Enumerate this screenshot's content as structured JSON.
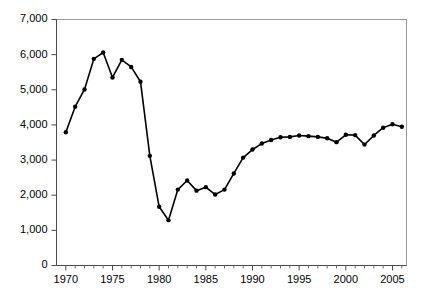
{
  "chart_data": {
    "type": "line",
    "title": "",
    "xlabel": "",
    "ylabel": "",
    "xlim": [
      1969,
      2006.5
    ],
    "ylim": [
      0,
      7000
    ],
    "grid": false,
    "legend": null,
    "y_ticks": [
      0,
      1000,
      2000,
      3000,
      4000,
      5000,
      6000,
      7000
    ],
    "y_tick_labels": [
      "0",
      "1,000",
      "2,000",
      "3,000",
      "4,000",
      "5,000",
      "6,000",
      "7,000"
    ],
    "x_ticks": [
      1970,
      1975,
      1980,
      1985,
      1990,
      1995,
      2000,
      2005
    ],
    "x_tick_labels": [
      "1970",
      "1975",
      "1980",
      "1985",
      "1990",
      "1995",
      "2000",
      "2005"
    ],
    "x_minor_ticks": [
      1971,
      1972,
      1973,
      1974,
      1976,
      1977,
      1978,
      1979,
      1981,
      1982,
      1983,
      1984,
      1986,
      1987,
      1988,
      1989,
      1991,
      1992,
      1993,
      1994,
      1996,
      1997,
      1998,
      1999,
      2001,
      2002,
      2003,
      2004,
      2006
    ],
    "series": [
      {
        "name": "series-1",
        "color": "#000000",
        "marker": "circle",
        "x": [
          1970,
          1971,
          1972,
          1973,
          1974,
          1975,
          1976,
          1977,
          1978,
          1979,
          1980,
          1981,
          1982,
          1983,
          1984,
          1985,
          1986,
          1987,
          1988,
          1989,
          1990,
          1991,
          1992,
          1993,
          1994,
          1995,
          1996,
          1997,
          1998,
          1999,
          2000,
          2001,
          2002,
          2003,
          2004,
          2005,
          2006
        ],
        "values": [
          3790,
          4520,
          5010,
          5880,
          6060,
          5350,
          5850,
          5650,
          5230,
          3120,
          1670,
          1290,
          2160,
          2420,
          2130,
          2230,
          2020,
          2160,
          2620,
          3070,
          3300,
          3470,
          3570,
          3650,
          3660,
          3700,
          3680,
          3660,
          3620,
          3510,
          3720,
          3710,
          3440,
          3700,
          3920,
          4020,
          3950
        ]
      }
    ]
  },
  "axes": {
    "y_label_suffix": "",
    "x_label_suffix": ""
  }
}
